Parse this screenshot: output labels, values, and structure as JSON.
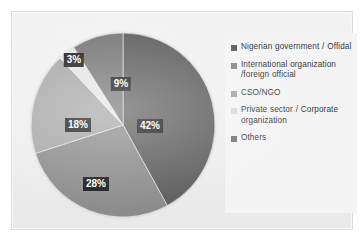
{
  "chart_data": {
    "type": "pie",
    "title": "",
    "subtitle": "",
    "xlabel": "",
    "ylabel": "",
    "grid": false,
    "legend_position": "right",
    "start_angle_deg": 0,
    "direction": "clockwise",
    "categories": [
      "Nigerian government / Offidal",
      "International organization /foreign official",
      "CSO/NGO",
      "Private sector / Corporate organization",
      "Others"
    ],
    "values": [
      42,
      28,
      18,
      3,
      9
    ],
    "value_labels": [
      "42%",
      "28%",
      "18%",
      "3%",
      "9%"
    ],
    "colors": [
      "#5e5e5e",
      "#8c8c8c",
      "#a6a6a6",
      "#e4e4e4",
      "#767676"
    ]
  },
  "legend": {
    "items": [
      {
        "label": "Nigerian government / Offidal",
        "color": "#5e5e5e"
      },
      {
        "label": "International organization /foreign official",
        "color": "#8c8c8c"
      },
      {
        "label": "CSO/NGO",
        "color": "#a6a6a6"
      },
      {
        "label": "Private sector / Corporate organization",
        "color": "#d9d9d9"
      },
      {
        "label": "Others",
        "color": "#767676"
      }
    ]
  },
  "slice_labels": [
    {
      "text": "42%",
      "x": 120,
      "y": 94
    },
    {
      "text": "28%",
      "x": 66,
      "y": 152
    },
    {
      "text": "18%",
      "x": 48,
      "y": 93
    },
    {
      "text": "3%",
      "x": 44,
      "y": 28
    },
    {
      "text": "9%",
      "x": 91,
      "y": 52
    }
  ],
  "figure": {
    "background": "#ffffff",
    "panel_background": "#f0f0f0",
    "legend_background": "#f4f4f4",
    "label_text_color": "#ffffff",
    "label_background": "#1b1b1b"
  }
}
